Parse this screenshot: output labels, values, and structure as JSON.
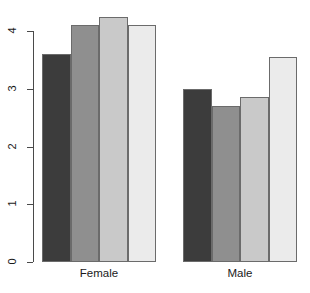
{
  "chart_data": {
    "type": "bar",
    "title": "",
    "subtitle": "",
    "xlabel": "",
    "ylabel": "",
    "grid": false,
    "legend": "none",
    "orientation": "vertical",
    "grouped": true,
    "categories": [
      "Female",
      "Male"
    ],
    "yticks": [
      "0",
      "1",
      "2",
      "3",
      "4"
    ],
    "ytick_values": [
      0,
      1,
      2,
      3,
      4
    ],
    "ylim": [
      0,
      4.35
    ],
    "bar_colors": [
      "#3c3c3c",
      "#8f8f8f",
      "#c9c9c9",
      "#ebebeb"
    ],
    "bar_border_color": "#6b6b6b",
    "axis_color": "#4a4a4a",
    "series": [
      {
        "name": "1",
        "color": "#3c3c3c",
        "values": [
          3.6,
          3.0
        ]
      },
      {
        "name": "2",
        "color": "#8f8f8f",
        "values": [
          4.1,
          2.7
        ]
      },
      {
        "name": "3",
        "color": "#c9c9c9",
        "values": [
          4.25,
          2.85
        ]
      },
      {
        "name": "4",
        "color": "#ebebeb",
        "values": [
          4.1,
          3.55
        ]
      }
    ],
    "groups": [
      {
        "label": "Female",
        "bars": [
          {
            "series": "1",
            "value": 3.6,
            "color": "#3c3c3c"
          },
          {
            "series": "2",
            "value": 4.1,
            "color": "#8f8f8f"
          },
          {
            "series": "3",
            "value": 4.25,
            "color": "#c9c9c9"
          },
          {
            "series": "4",
            "value": 4.1,
            "color": "#ebebeb"
          }
        ]
      },
      {
        "label": "Male",
        "bars": [
          {
            "series": "1",
            "value": 3.0,
            "color": "#3c3c3c"
          },
          {
            "series": "2",
            "value": 2.7,
            "color": "#8f8f8f"
          },
          {
            "series": "3",
            "value": 2.85,
            "color": "#c9c9c9"
          },
          {
            "series": "4",
            "value": 3.55,
            "color": "#ebebeb"
          }
        ]
      }
    ]
  }
}
